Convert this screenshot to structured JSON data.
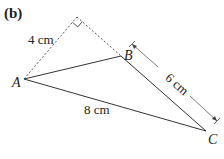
{
  "diagram": {
    "part_label": "(b)",
    "vertices": {
      "A": {
        "label": "A",
        "x": 24,
        "y": 79
      },
      "B": {
        "label": "B",
        "x": 121,
        "y": 56
      },
      "C": {
        "label": "C",
        "x": 206,
        "y": 131
      },
      "R": {
        "label": "",
        "x": 77,
        "y": 17
      }
    },
    "measurements": {
      "dashed_side": "4 cm",
      "BC": "6 cm",
      "AC": "8 cm"
    },
    "colors": {
      "line": "#333333",
      "text": "#222222"
    }
  }
}
